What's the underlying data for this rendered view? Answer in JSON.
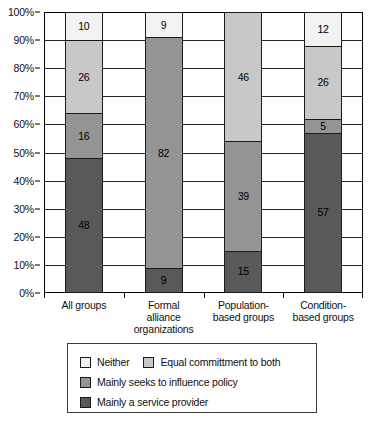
{
  "chart_data": {
    "type": "bar",
    "subtype": "stacked-percentage",
    "title": "",
    "xlabel": "",
    "ylabel": "",
    "ylim": [
      0,
      100
    ],
    "ytick_labels": [
      "0%",
      "10%",
      "20%",
      "30%",
      "40%",
      "50%",
      "60%",
      "70%",
      "80%",
      "90%",
      "100%"
    ],
    "ytick_values": [
      0,
      10,
      20,
      30,
      40,
      50,
      60,
      70,
      80,
      90,
      100
    ],
    "grid": true,
    "legend_position": "bottom",
    "categories": [
      "All groups",
      "Formal alliance organizations",
      "Population-based groups",
      "Condition-based groups"
    ],
    "category_label_lines": [
      [
        "All groups"
      ],
      [
        "Formal",
        "alliance",
        "organizations"
      ],
      [
        "Population-",
        "based groups"
      ],
      [
        "Condition-",
        "based groups"
      ]
    ],
    "series": [
      {
        "name": "Mainly a service provider",
        "color": "#595959",
        "values": [
          48,
          9,
          15,
          57
        ],
        "labels": [
          "48",
          "9",
          "15",
          "57"
        ]
      },
      {
        "name": "Mainly seeks to influence policy",
        "color": "#949494",
        "values": [
          16,
          82,
          39,
          5
        ],
        "labels": [
          "16",
          "82",
          "39",
          "5"
        ]
      },
      {
        "name": "Equal commitment to both",
        "color": "#c8c8c8",
        "values": [
          26,
          0,
          46,
          26
        ],
        "labels": [
          "26",
          "",
          "46",
          "26"
        ]
      },
      {
        "name": "Neither",
        "color": "#f2f2f2",
        "values": [
          10,
          9,
          0,
          12
        ],
        "labels": [
          "10",
          "9",
          "",
          "12"
        ]
      }
    ],
    "legend_entries": [
      {
        "label": "Neither",
        "color": "#f2f2f2"
      },
      {
        "label": "Equal committment to both",
        "color": "#c8c8c8"
      },
      {
        "label": "Mainly seeks to influence policy",
        "color": "#949494"
      },
      {
        "label": "Mainly a service provider",
        "color": "#595959"
      }
    ]
  },
  "caption": ""
}
